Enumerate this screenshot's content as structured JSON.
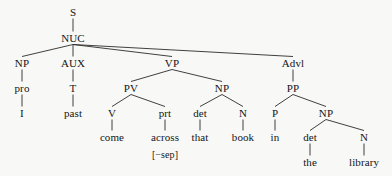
{
  "diagram": {
    "type": "syntax-tree",
    "sentence": "I came across that book in the library",
    "colors": {
      "background": "#f8f8f7",
      "text": "#151515",
      "edge": "#2b2b2b"
    },
    "nodes": [
      {
        "id": "S",
        "label": "S",
        "kind": "cat",
        "x": 73,
        "y": 12
      },
      {
        "id": "NUC",
        "label": "NUC",
        "kind": "cat",
        "x": 73,
        "y": 38
      },
      {
        "id": "NP1",
        "label": "NP",
        "kind": "cat",
        "x": 22,
        "y": 63
      },
      {
        "id": "pro",
        "label": "pro",
        "kind": "cat",
        "x": 22,
        "y": 88
      },
      {
        "id": "I",
        "label": "I",
        "kind": "term",
        "x": 22,
        "y": 113
      },
      {
        "id": "AUX",
        "label": "AUX",
        "kind": "cat",
        "x": 73,
        "y": 63
      },
      {
        "id": "T",
        "label": "T",
        "kind": "cat",
        "x": 73,
        "y": 88
      },
      {
        "id": "past",
        "label": "past",
        "kind": "term",
        "x": 73,
        "y": 113
      },
      {
        "id": "VP",
        "label": "VP",
        "kind": "cat",
        "x": 172,
        "y": 63
      },
      {
        "id": "PV",
        "label": "PV",
        "kind": "cat",
        "x": 131,
        "y": 88
      },
      {
        "id": "V",
        "label": "V",
        "kind": "cat",
        "x": 112,
        "y": 113
      },
      {
        "id": "come",
        "label": "come",
        "kind": "term",
        "x": 112,
        "y": 137
      },
      {
        "id": "prt",
        "label": "prt",
        "kind": "cat",
        "x": 165,
        "y": 113
      },
      {
        "id": "across",
        "label": "across",
        "kind": "term",
        "x": 165,
        "y": 137
      },
      {
        "id": "sep",
        "label": "[−sep]",
        "kind": "feat",
        "x": 165,
        "y": 155
      },
      {
        "id": "NP2",
        "label": "NP",
        "kind": "cat",
        "x": 222,
        "y": 88
      },
      {
        "id": "det1",
        "label": "det",
        "kind": "cat",
        "x": 200,
        "y": 113
      },
      {
        "id": "that",
        "label": "that",
        "kind": "term",
        "x": 200,
        "y": 137
      },
      {
        "id": "N1",
        "label": "N",
        "kind": "cat",
        "x": 243,
        "y": 113
      },
      {
        "id": "book",
        "label": "book",
        "kind": "term",
        "x": 243,
        "y": 137
      },
      {
        "id": "Advl",
        "label": "Advl",
        "kind": "cat",
        "x": 293,
        "y": 63
      },
      {
        "id": "PP",
        "label": "PP",
        "kind": "cat",
        "x": 293,
        "y": 88
      },
      {
        "id": "P",
        "label": "P",
        "kind": "cat",
        "x": 275,
        "y": 113
      },
      {
        "id": "in",
        "label": "in",
        "kind": "term",
        "x": 275,
        "y": 137
      },
      {
        "id": "NP3",
        "label": "NP",
        "kind": "cat",
        "x": 326,
        "y": 113
      },
      {
        "id": "det2",
        "label": "det",
        "kind": "cat",
        "x": 310,
        "y": 137
      },
      {
        "id": "the",
        "label": "the",
        "kind": "term",
        "x": 310,
        "y": 162
      },
      {
        "id": "N2",
        "label": "N",
        "kind": "cat",
        "x": 364,
        "y": 137
      },
      {
        "id": "library",
        "label": "library",
        "kind": "term",
        "x": 364,
        "y": 162
      }
    ],
    "edges": [
      {
        "from": "S",
        "to": "NUC"
      },
      {
        "from": "NUC",
        "to": "NP1"
      },
      {
        "from": "NUC",
        "to": "AUX"
      },
      {
        "from": "NUC",
        "to": "VP"
      },
      {
        "from": "NUC",
        "to": "Advl"
      },
      {
        "from": "NP1",
        "to": "pro"
      },
      {
        "from": "pro",
        "to": "I"
      },
      {
        "from": "AUX",
        "to": "T"
      },
      {
        "from": "T",
        "to": "past"
      },
      {
        "from": "VP",
        "to": "PV"
      },
      {
        "from": "VP",
        "to": "NP2"
      },
      {
        "from": "PV",
        "to": "V"
      },
      {
        "from": "PV",
        "to": "prt"
      },
      {
        "from": "V",
        "to": "come"
      },
      {
        "from": "prt",
        "to": "across"
      },
      {
        "from": "NP2",
        "to": "det1"
      },
      {
        "from": "NP2",
        "to": "N1"
      },
      {
        "from": "det1",
        "to": "that"
      },
      {
        "from": "N1",
        "to": "book"
      },
      {
        "from": "Advl",
        "to": "PP"
      },
      {
        "from": "PP",
        "to": "P"
      },
      {
        "from": "PP",
        "to": "NP3"
      },
      {
        "from": "P",
        "to": "in"
      },
      {
        "from": "NP3",
        "to": "det2"
      },
      {
        "from": "NP3",
        "to": "N2"
      },
      {
        "from": "det2",
        "to": "the"
      },
      {
        "from": "N2",
        "to": "library"
      }
    ]
  }
}
